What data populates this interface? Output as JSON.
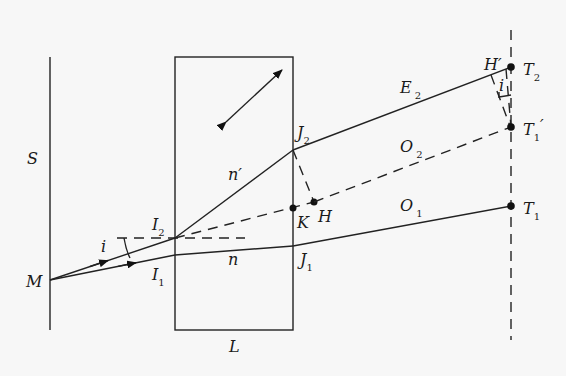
{
  "figure": {
    "labels": {
      "screen": "S",
      "plate": "L",
      "source": "M",
      "I2": {
        "base": "I",
        "sub": "2"
      },
      "I1": {
        "base": "I",
        "sub": "1"
      },
      "J2": {
        "base": "J",
        "sub": "2"
      },
      "J1": {
        "base": "J",
        "sub": "1"
      },
      "K": "K",
      "H": "H",
      "H_prime": "H′",
      "T2": {
        "base": "T",
        "sub": "2"
      },
      "T1_prime": {
        "base": "T",
        "sub": "1",
        "prime": "′"
      },
      "T1": {
        "base": "T",
        "sub": "1"
      },
      "E2": {
        "base": "E",
        "sub": "2"
      },
      "O2": {
        "base": "O",
        "sub": "2"
      },
      "O1": {
        "base": "O",
        "sub": "1"
      },
      "index_n": "n",
      "index_n_prime": "n′",
      "angle_i_left": "i",
      "angle_i_right": "i"
    },
    "colors": {
      "background": "#f7f7f7",
      "ink": "#222222"
    }
  }
}
